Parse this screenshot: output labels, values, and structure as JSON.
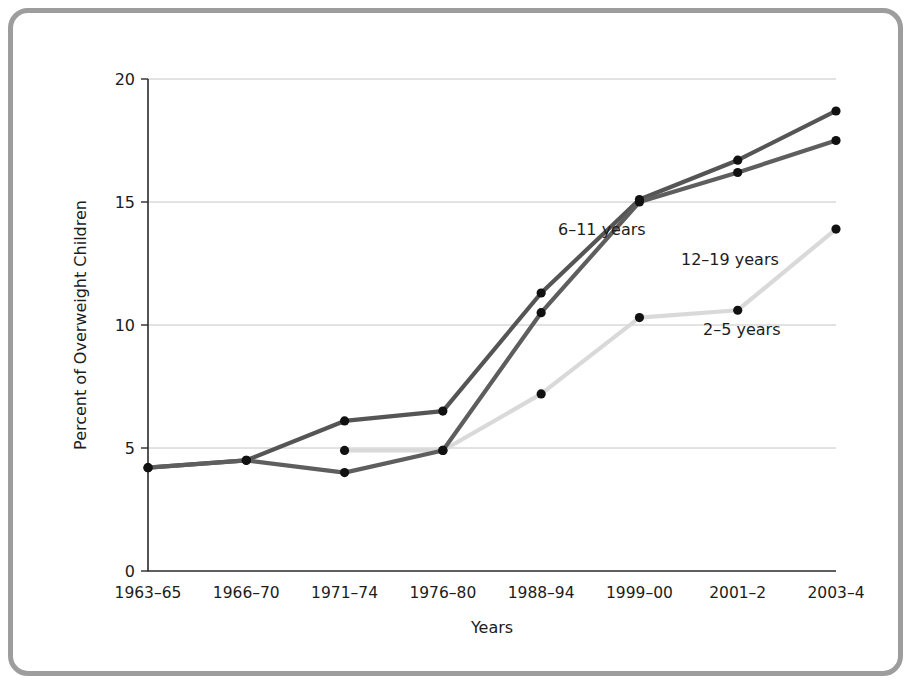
{
  "chart_data": {
    "type": "line",
    "title": "",
    "xlabel": "Years",
    "ylabel": "Percent of Overweight Children",
    "categories": [
      "1963–65",
      "1966–70",
      "1971–74",
      "1976–80",
      "1988–94",
      "1999–00",
      "2001–2",
      "2003–4"
    ],
    "ylim": [
      0,
      20
    ],
    "yticks": [
      0,
      5,
      10,
      15,
      20
    ],
    "ytick_labels": [
      "0",
      "5",
      "10",
      "15",
      "20"
    ],
    "grid": true,
    "legend_position": "inline-annotations",
    "series": [
      {
        "name": "6–11 years",
        "color": "#555555",
        "values": [
          4.2,
          4.5,
          6.1,
          6.5,
          11.3,
          15.1,
          16.7,
          18.7
        ],
        "label_x_px": 545,
        "label_y_px": 222
      },
      {
        "name": "12–19 years",
        "color": "#5e5e5e",
        "values": [
          4.2,
          4.5,
          4.0,
          4.9,
          10.5,
          15.0,
          16.2,
          17.5
        ],
        "label_x_px": 668,
        "label_y_px": 252
      },
      {
        "name": "2–5 years",
        "color": "#d9d9d9",
        "values": [
          null,
          null,
          4.9,
          4.9,
          7.2,
          10.3,
          10.6,
          13.9
        ],
        "label_x_px": 690,
        "label_y_px": 322
      }
    ],
    "marker_color": "#111111",
    "marker_radius": 4.6,
    "line_width": 4.2,
    "axis_color": "#2b2b2b",
    "grid_color": "#bfbfbf",
    "frame_color": "#9d9d9d",
    "background": "#ffffff"
  },
  "geometry": {
    "plot_left_px": 135,
    "plot_right_px": 823,
    "plot_top_px": 66,
    "plot_bottom_px": 558
  }
}
